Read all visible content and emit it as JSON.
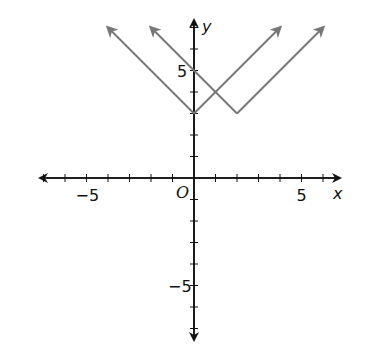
{
  "chart_data": {
    "type": "line",
    "title": "",
    "xlabel": "x",
    "ylabel": "y",
    "origin_label": "O",
    "xlim": [
      -7,
      7
    ],
    "ylim": [
      -7,
      7.5
    ],
    "x_tick_step": 1,
    "y_tick_step": 1,
    "x_tick_labels": [
      {
        "value": -5,
        "label": "−5"
      },
      {
        "value": 5,
        "label": "5"
      }
    ],
    "y_tick_labels": [
      {
        "value": 5,
        "label": "5"
      },
      {
        "value": -5,
        "label": "−5"
      }
    ],
    "grid": false,
    "legend": null,
    "series": [
      {
        "name": "y = |x| + 3",
        "vertex": [
          0,
          3
        ],
        "points": [
          [
            -4,
            7
          ],
          [
            0,
            3
          ],
          [
            4,
            7
          ]
        ],
        "color": "#777777"
      },
      {
        "name": "y = |x - 2| + 3",
        "vertex": [
          2,
          3
        ],
        "points": [
          [
            -2,
            7
          ],
          [
            2,
            3
          ],
          [
            6,
            7
          ]
        ],
        "color": "#777777"
      }
    ],
    "axis_color": "#111111"
  }
}
